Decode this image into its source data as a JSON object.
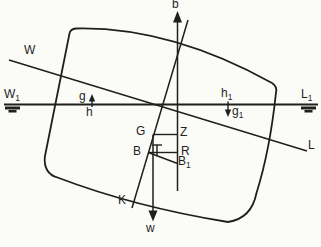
{
  "diagram": {
    "type": "ship-stability-heeled-hull-figure",
    "background_color": "#fbfbf8",
    "ink_color": "#1f1f1f",
    "labels": {
      "b": "b",
      "W": "W",
      "g": "g",
      "h": "h",
      "G": "G",
      "Z": "Z",
      "B": "B",
      "R": "R",
      "K": "K",
      "L": "L",
      "w": "w",
      "W1": {
        "base": "W",
        "sub": "1"
      },
      "L1": {
        "base": "L",
        "sub": "1"
      },
      "h1": {
        "base": "h",
        "sub": "1"
      },
      "g1": {
        "base": "g",
        "sub": "1"
      },
      "B1": {
        "base": "B",
        "sub": "1"
      }
    }
  }
}
